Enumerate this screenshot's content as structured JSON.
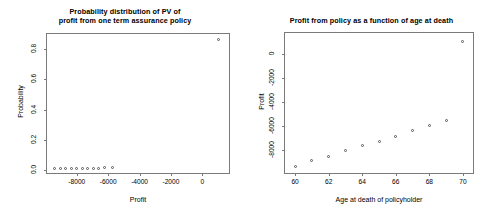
{
  "figure": {
    "panel_count": 2,
    "background": "#ffffff",
    "point_color": "#555555",
    "axis_color": "#7a7a7a"
  },
  "left_panel": {
    "title_line1": "Probability distribution of PV of",
    "title_line2": "profit from one term assurance policy",
    "xlabel": "Profit",
    "ylabel": "Probability",
    "xticks": [
      "-8000",
      "-6000",
      "-4000",
      "-2000",
      "0"
    ],
    "yticks": [
      "0.0",
      "0.2",
      "0.4",
      "0.6",
      "0.8"
    ]
  },
  "right_panel": {
    "title": "Profit from policy as a function of age at death",
    "xlabel": "Age at death of policyholder",
    "ylabel": "Profit",
    "xticks": [
      "60",
      "62",
      "64",
      "66",
      "68",
      "70"
    ],
    "yticks": [
      "0",
      "-2000",
      "-4000",
      "-6000",
      "-8000"
    ]
  },
  "chart_data": [
    {
      "type": "scatter",
      "title": "Probability distribution of PV of profit from one term assurance policy",
      "xlabel": "Profit",
      "ylabel": "Probability",
      "xlim": [
        -9900,
        1700
      ],
      "ylim": [
        -0.02,
        0.9
      ],
      "xticks": [
        -8000,
        -6000,
        -4000,
        -2000,
        0
      ],
      "yticks": [
        0.0,
        0.2,
        0.4,
        0.6,
        0.8
      ],
      "grid": false,
      "legend": "none",
      "x": [
        -9400,
        -9050,
        -8700,
        -8350,
        -8000,
        -7650,
        -7300,
        -6950,
        -6600,
        -6250,
        -5750,
        1000
      ],
      "y": [
        0.009,
        0.01,
        0.01,
        0.011,
        0.011,
        0.012,
        0.012,
        0.013,
        0.013,
        0.014,
        0.015,
        0.862
      ]
    },
    {
      "type": "scatter",
      "title": "Profit from policy as a function of age at death",
      "xlabel": "Age at death of policyholder",
      "ylabel": "Profit",
      "xlim": [
        59.4,
        70.6
      ],
      "ylim": [
        -9900,
        1700
      ],
      "xticks": [
        60,
        62,
        64,
        66,
        68,
        70
      ],
      "yticks": [
        0,
        -2000,
        -4000,
        -6000,
        -8000
      ],
      "grid": false,
      "legend": "none",
      "x": [
        60,
        61,
        62,
        63,
        64,
        65,
        66,
        67,
        68,
        69,
        70
      ],
      "y": [
        -9400,
        -8900,
        -8500,
        -8050,
        -7650,
        -7250,
        -6850,
        -6400,
        -5950,
        -5550,
        1000
      ]
    }
  ]
}
